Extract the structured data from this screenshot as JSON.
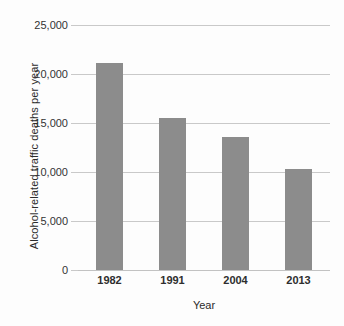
{
  "chart_data": {
    "type": "bar",
    "title": "",
    "xlabel": "Year",
    "ylabel": "Alcohol-related traffic deaths per year",
    "categories": [
      "1982",
      "1991",
      "2004",
      "2013"
    ],
    "values": [
      21100,
      15550,
      13550,
      10300
    ],
    "ylim": [
      0,
      25000
    ],
    "yticks": [
      0,
      5000,
      10000,
      15000,
      20000,
      25000
    ],
    "ytick_labels": [
      "0",
      "5,000",
      "10,000",
      "15,000",
      "20,000",
      "25,000"
    ],
    "grid": true,
    "legend": "none",
    "bar_color": "#8c8c8c",
    "gridline_color": "#c9c9c9",
    "background_color": "#fdfdfd"
  }
}
